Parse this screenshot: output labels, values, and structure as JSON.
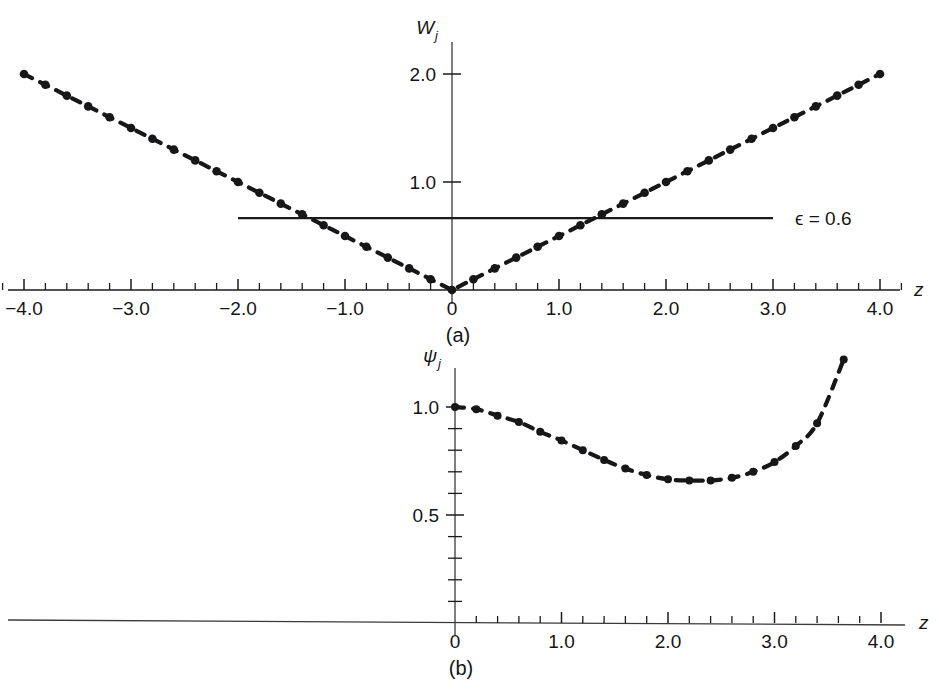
{
  "figure": {
    "background_color": "#ffffff",
    "ink_color": "#17171a",
    "panels": [
      "(a)",
      "(b)"
    ]
  },
  "panel_a": {
    "caption": "(a)",
    "y_axis_label": "W",
    "y_axis_sub": "j",
    "x_axis_label": "z",
    "annotation": "ϵ = 0.6",
    "annotation_symbol": "ϵ",
    "annotation_value": "0.6",
    "x_tick_labels": [
      "−4.0",
      "−3.0",
      "−2.0",
      "−1.0",
      "0",
      "1.0",
      "2.0",
      "3.0",
      "4.0"
    ],
    "x_tick_values": [
      -4.0,
      -3.0,
      -2.0,
      -1.0,
      0,
      1.0,
      2.0,
      3.0,
      4.0
    ],
    "y_tick_labels": [
      "1.0",
      "2.0"
    ],
    "y_tick_values": [
      1.0,
      2.0
    ]
  },
  "panel_b": {
    "caption": "(b)",
    "y_axis_label": "ψ",
    "y_axis_sub": "j",
    "x_axis_label": "z",
    "x_tick_labels": [
      "0",
      "1.0",
      "2.0",
      "3.0",
      "4.0"
    ],
    "x_tick_values": [
      0,
      1.0,
      2.0,
      3.0,
      4.0
    ],
    "y_tick_labels": [
      "0.5",
      "1.0"
    ],
    "y_tick_values": [
      0.5,
      1.0
    ]
  },
  "chart_data": [
    {
      "type": "line",
      "panel": "(a)",
      "title": "",
      "xlabel": "z",
      "ylabel": "W_j",
      "xlim": [
        -4.3,
        4.3
      ],
      "ylim": [
        0.0,
        2.3
      ],
      "x_major_ticks": [
        -4.0,
        -3.0,
        -2.0,
        -1.0,
        0.0,
        1.0,
        2.0,
        3.0,
        4.0
      ],
      "x_minor_tick_step": 0.2,
      "y_major_ticks": [
        1.0,
        2.0
      ],
      "y_minor_tick_step": 0.2,
      "grid": false,
      "legend": null,
      "marker": "circle",
      "linestyle": "dashed",
      "annotations": [
        {
          "text": "ϵ = 0.6",
          "kind": "horizontal-line-with-label",
          "y": 0.665,
          "x_start": -2.0,
          "x_end": 3.0,
          "label_x": 3.15
        }
      ],
      "series": [
        {
          "name": "W_j",
          "x": [
            -4.0,
            -3.8,
            -3.6,
            -3.4,
            -3.2,
            -3.0,
            -2.8,
            -2.6,
            -2.4,
            -2.2,
            -2.0,
            -1.8,
            -1.6,
            -1.4,
            -1.2,
            -1.0,
            -0.8,
            -0.6,
            -0.4,
            -0.2,
            0.0,
            0.2,
            0.4,
            0.6,
            0.8,
            1.0,
            1.2,
            1.4,
            1.6,
            1.8,
            2.0,
            2.2,
            2.4,
            2.6,
            2.8,
            3.0,
            3.2,
            3.4,
            3.6,
            3.8,
            4.0
          ],
          "y": [
            2.0,
            1.9,
            1.8,
            1.7,
            1.6,
            1.5,
            1.4,
            1.3,
            1.2,
            1.1,
            1.0,
            0.9,
            0.8,
            0.7,
            0.6,
            0.5,
            0.4,
            0.3,
            0.2,
            0.1,
            0.0,
            0.1,
            0.2,
            0.3,
            0.4,
            0.5,
            0.6,
            0.7,
            0.8,
            0.9,
            1.0,
            1.1,
            1.2,
            1.3,
            1.4,
            1.5,
            1.6,
            1.7,
            1.8,
            1.9,
            2.0
          ]
        }
      ]
    },
    {
      "type": "line",
      "panel": "(b)",
      "title": "",
      "xlabel": "z",
      "ylabel": "ψ_j",
      "xlim": [
        0.0,
        4.3
      ],
      "ylim": [
        0.0,
        1.3
      ],
      "x_major_ticks": [
        0.0,
        1.0,
        2.0,
        3.0,
        4.0
      ],
      "x_minor_tick_step": 0.2,
      "y_major_ticks": [
        0.5,
        1.0
      ],
      "y_minor_tick_step": 0.1,
      "grid": false,
      "legend": null,
      "marker": "circle",
      "linestyle": "dashed",
      "annotations": [],
      "series": [
        {
          "name": "ψ_j",
          "x": [
            0.0,
            0.2,
            0.4,
            0.6,
            0.8,
            1.0,
            1.2,
            1.4,
            1.6,
            1.8,
            2.0,
            2.2,
            2.4,
            2.6,
            2.8,
            3.0,
            3.2,
            3.4,
            3.65
          ],
          "y": [
            1.0,
            0.99,
            0.96,
            0.93,
            0.885,
            0.845,
            0.8,
            0.755,
            0.715,
            0.685,
            0.665,
            0.66,
            0.66,
            0.672,
            0.7,
            0.745,
            0.82,
            0.925,
            1.22
          ]
        }
      ]
    }
  ]
}
